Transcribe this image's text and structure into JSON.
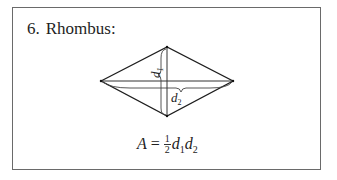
{
  "section": {
    "number": "6.",
    "title": "Rhombus:"
  },
  "figure": {
    "shape": "rhombus",
    "labels": {
      "d1": "d",
      "d1_sub": "1",
      "d2": "d",
      "d2_sub": "2"
    }
  },
  "formula": {
    "lhs": "A",
    "eq": "=",
    "frac_num": "1",
    "frac_den": "2",
    "v1": "d",
    "v1_sub": "1",
    "v2": "d",
    "v2_sub": "2"
  }
}
